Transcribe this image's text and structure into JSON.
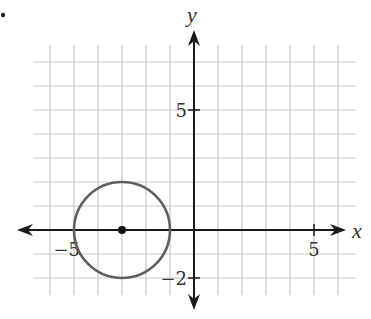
{
  "chart_data": {
    "type": "scatter",
    "title": "",
    "xlabel": "x",
    "ylabel": "y",
    "xlim": [
      -6,
      6
    ],
    "ylim": [
      -2,
      7
    ],
    "grid": true,
    "x_tick_labels": [
      {
        "value": -5,
        "label": "−5"
      },
      {
        "value": 5,
        "label": "5"
      }
    ],
    "y_tick_labels": [
      {
        "value": 5,
        "label": "5"
      },
      {
        "value": -2,
        "label": "−2"
      }
    ],
    "shapes": [
      {
        "kind": "circle",
        "center": [
          -3,
          0
        ],
        "radius": 2,
        "color": "#5e5e5e"
      }
    ],
    "points": [
      {
        "x": -3,
        "y": 0,
        "label": "center"
      }
    ],
    "colors": {
      "grid": "#c8c8c8",
      "axis": "#1a1a1a",
      "circle": "#5e5e5e",
      "point": "#111111"
    }
  },
  "layout": {
    "origin_px": [
      194,
      230
    ],
    "unit_px": 24,
    "grid_x_range": [
      -6,
      6
    ],
    "grid_y_range": [
      -2,
      7
    ],
    "grid_vertical_extent_px": [
      45,
      295
    ],
    "grid_horizontal_extent_px": [
      33,
      356
    ],
    "x_axis_px": [
      17,
      346
    ],
    "y_axis_px": [
      30,
      310
    ]
  }
}
